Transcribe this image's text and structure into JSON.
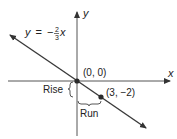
{
  "diagram": {
    "equation": {
      "y": "y",
      "eq": "=",
      "minus": "−",
      "num": "2",
      "den": "3",
      "x": "x"
    },
    "axes": {
      "x_label": "x",
      "y_label": "y"
    },
    "points": [
      {
        "label": "(0, 0)"
      },
      {
        "label": "(3, −2)"
      }
    ],
    "annotations": {
      "rise": "Rise",
      "run": "Run"
    },
    "colors": {
      "line": "#3a3a3a",
      "point": "#2a2a2a"
    }
  }
}
